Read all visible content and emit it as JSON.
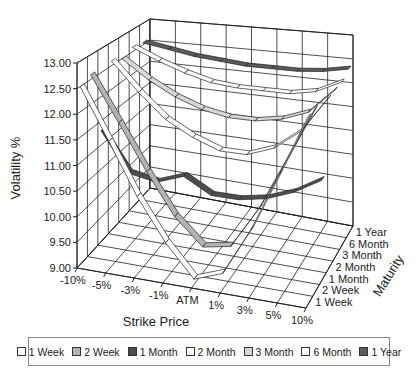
{
  "chart_data": {
    "type": "surface-3d-ribbon",
    "title": "",
    "xlabel": "Strike Price",
    "ylabel": "Volatility %",
    "zlabel": "Maturity",
    "x_categories": [
      "-10%",
      "-5%",
      "-3%",
      "-1%",
      "ATM",
      "1%",
      "3%",
      "5%",
      "10%"
    ],
    "depth_categories": [
      "1 Week",
      "2 Week",
      "1 Month",
      "2 Month",
      "3 Month",
      "6 Month",
      "1 Year"
    ],
    "yticks": [
      "9.00",
      "9.50",
      "10.00",
      "10.50",
      "11.00",
      "11.50",
      "12.00",
      "12.50",
      "13.00"
    ],
    "ylim": [
      9,
      13
    ],
    "grid": true,
    "legend_position": "bottom",
    "series": [
      {
        "name": "1 Week",
        "color": "#ffffff",
        "values": [
          12.5,
          11.5,
          10.5,
          9.7,
          9.1,
          9.3,
          10.2,
          11.3,
          12.4
        ]
      },
      {
        "name": "2 Week",
        "color": "#b3b3b3",
        "values": [
          12.6,
          11.7,
          10.8,
          10.0,
          9.5,
          9.6,
          10.4,
          11.4,
          12.4
        ]
      },
      {
        "name": "1 Month",
        "color": "#4d4d4d",
        "values": [
          11.3,
          10.5,
          10.4,
          10.6,
          10.3,
          10.3,
          10.4,
          10.6,
          10.9
        ]
      },
      {
        "name": "2 Month",
        "color": "#ffffff",
        "values": [
          12.6,
          12.0,
          11.5,
          11.2,
          11.0,
          11.0,
          11.2,
          11.6,
          12.3
        ]
      },
      {
        "name": "3 Month",
        "color": "#d6d6d6",
        "values": [
          12.5,
          12.1,
          11.8,
          11.6,
          11.5,
          11.5,
          11.6,
          11.8,
          12.3
        ]
      },
      {
        "name": "6 Month",
        "color": "#ffffff",
        "values": [
          12.6,
          12.35,
          12.15,
          12.0,
          11.95,
          11.95,
          11.95,
          12.05,
          12.3
        ]
      },
      {
        "name": "1 Year",
        "color": "#5a5a5a",
        "values": [
          12.55,
          12.45,
          12.35,
          12.3,
          12.25,
          12.25,
          12.25,
          12.3,
          12.4
        ]
      }
    ]
  },
  "axes": {
    "y_title": "Volatility %",
    "x_title": "Strike Price",
    "depth_title": "Maturity"
  },
  "legend": {
    "items": [
      {
        "label": "1 Week",
        "color": "#ffffff"
      },
      {
        "label": "2 Week",
        "color": "#b3b3b3"
      },
      {
        "label": "1 Month",
        "color": "#4d4d4d"
      },
      {
        "label": "2 Month",
        "color": "#ffffff"
      },
      {
        "label": "3 Month",
        "color": "#d6d6d6"
      },
      {
        "label": "6 Month",
        "color": "#ffffff"
      },
      {
        "label": "1 Year",
        "color": "#5a5a5a"
      }
    ]
  }
}
